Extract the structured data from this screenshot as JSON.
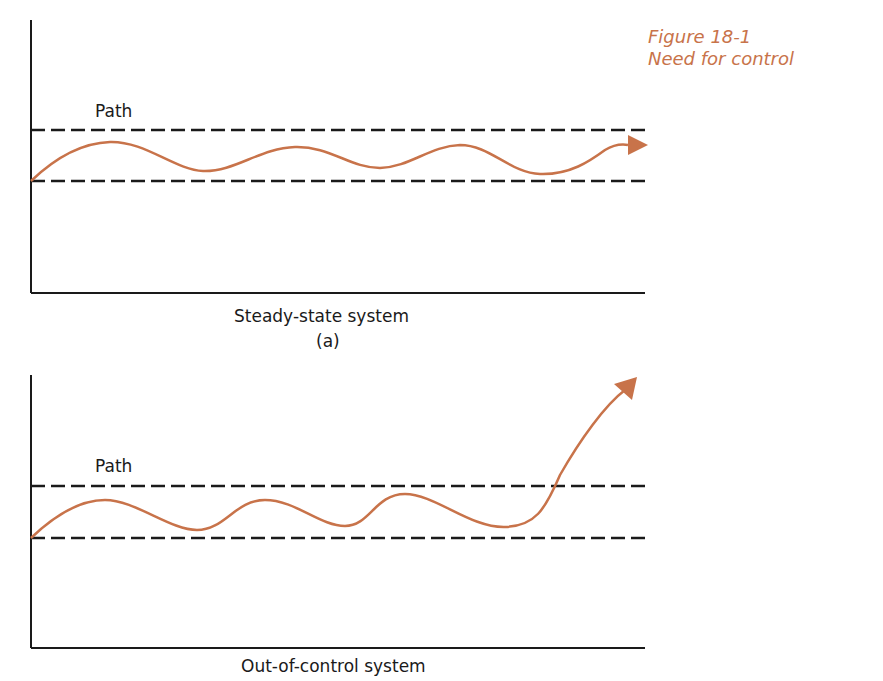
{
  "figure": {
    "number": "Figure 18-1",
    "title": "Need for control"
  },
  "panels": [
    {
      "id": "a",
      "path_label": "Path",
      "caption": "Steady-state system",
      "sublabel": "(a)"
    },
    {
      "id": "b",
      "path_label": "Path",
      "caption": "Out-of-control system"
    }
  ],
  "colors": {
    "accent": "#c8734a",
    "axis": "#1a1a1a",
    "dashed": "#1a1a1a"
  }
}
